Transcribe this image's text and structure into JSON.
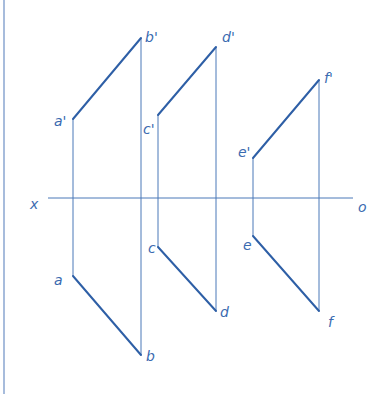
{
  "diagram": {
    "type": "orthographic-projection",
    "colors": {
      "line": "#2e5fa6",
      "projector": "#4a78b8",
      "label": "#3a6ab0",
      "border": "#8aa6d0",
      "background": "#ffffff"
    },
    "axis": {
      "x_label": "x",
      "o_label": "o",
      "x1": 48,
      "x2": 353,
      "y": 198
    },
    "segments": [
      {
        "name": "ab",
        "front_start": {
          "label": "a'",
          "x": 73,
          "y": 119
        },
        "front_end": {
          "label": "b'",
          "x": 141,
          "y": 38
        },
        "top_start": {
          "label": "a",
          "x": 73,
          "y": 276
        },
        "top_end": {
          "label": "b",
          "x": 141,
          "y": 355
        }
      },
      {
        "name": "cd",
        "front_start": {
          "label": "c'",
          "x": 158,
          "y": 115
        },
        "front_end": {
          "label": "d'",
          "x": 216,
          "y": 47
        },
        "top_start": {
          "label": "c",
          "x": 158,
          "y": 247
        },
        "top_end": {
          "label": "d",
          "x": 216,
          "y": 311
        }
      },
      {
        "name": "ef",
        "front_start": {
          "label": "e'",
          "x": 253,
          "y": 158
        },
        "front_end": {
          "label": "f'",
          "x": 319,
          "y": 80
        },
        "top_start": {
          "label": "e",
          "x": 253,
          "y": 236
        },
        "top_end": {
          "label": "f",
          "x": 319,
          "y": 311
        }
      }
    ]
  }
}
